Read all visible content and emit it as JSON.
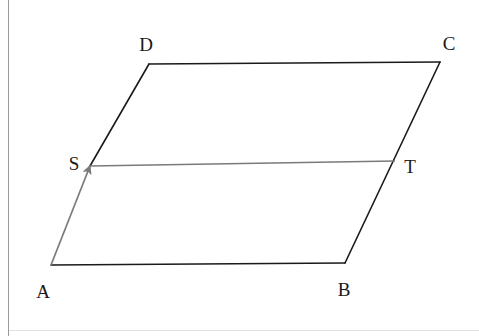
{
  "figure": {
    "background_color": "#ffffff",
    "stroke_color": "#1a1a1a",
    "vector_color": "#7a7a7a",
    "segment_color": "#7a7a7a",
    "page_border_color": "#9a9a9a"
  },
  "labels": {
    "a": "A",
    "b": "B",
    "c": "C",
    "d": "D",
    "s": "S",
    "t": "T"
  },
  "points": {
    "A": {
      "x": 51,
      "y": 265
    },
    "B": {
      "x": 345,
      "y": 263
    },
    "C": {
      "x": 440,
      "y": 62
    },
    "D": {
      "x": 149,
      "y": 64
    },
    "S": {
      "x": 90,
      "y": 166
    },
    "T": {
      "x": 395,
      "y": 161
    }
  },
  "label_positions": {
    "A": {
      "x": 43,
      "y": 291
    },
    "B": {
      "x": 344,
      "y": 289
    },
    "C": {
      "x": 449,
      "y": 43
    },
    "D": {
      "x": 146,
      "y": 44
    },
    "S": {
      "x": 74,
      "y": 163
    },
    "T": {
      "x": 410,
      "y": 166
    }
  },
  "edges": [
    {
      "name": "AB",
      "from": "A",
      "to": "B",
      "style": "solid-black"
    },
    {
      "name": "BC",
      "from": "B",
      "to": "C",
      "style": "solid-black"
    },
    {
      "name": "CD",
      "from": "C",
      "to": "D",
      "style": "solid-black"
    },
    {
      "name": "DS",
      "from": "D",
      "to": "S",
      "style": "solid-black"
    }
  ],
  "vectors": [
    {
      "name": "AS",
      "from": "A",
      "to": "S",
      "style": "gray-arrow",
      "arrowhead": "at-S"
    }
  ],
  "segments": [
    {
      "name": "ST",
      "from": "S",
      "to": "T",
      "style": "gray-line"
    }
  ]
}
